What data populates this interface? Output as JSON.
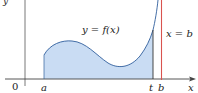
{
  "diagram": {
    "labels": {
      "curve": "y = f(x)",
      "asymptote": "x = b",
      "origin": "0",
      "a": "a",
      "t": "t",
      "b": "b",
      "x_axis": "x",
      "y_axis": "y"
    },
    "colors": {
      "fill": "#c9dcf3",
      "curve": "#2f5e9c",
      "asymptote": "#d9534f",
      "axis": "#444444",
      "t_line": "#333333"
    }
  }
}
